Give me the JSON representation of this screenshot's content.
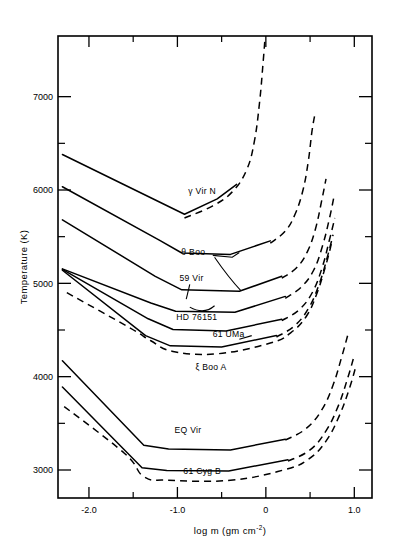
{
  "chart_data": {
    "type": "line",
    "title": "",
    "xlabel": "log m  (gm cm-2)",
    "xlabel_main": "log m  (gm cm",
    "xlabel_sup": "-2",
    "xlabel_tail": ")",
    "ylabel": "Temperature (K)",
    "xlim": [
      -2.35,
      1.2
    ],
    "ylim": [
      2700,
      7650
    ],
    "grid": false,
    "legend_position": "inline-labels",
    "xticks": [
      -2.0,
      -1.0,
      0,
      1.0
    ],
    "xticklabels": [
      "-2.0",
      "-1.0",
      "0",
      "1.0"
    ],
    "yticks": [
      7000,
      6000,
      5000,
      4000,
      3000
    ],
    "yticklabels": [
      "7000",
      "6000",
      "5000",
      "4000",
      "3000"
    ],
    "yminorticks": [
      6500,
      5500,
      4500,
      3500
    ],
    "xminorticks": [
      -1.5,
      -0.5,
      0.5
    ],
    "series": [
      {
        "name": "gamma Vir N",
        "label": "γ Vir N",
        "label_x": -0.72,
        "label_y": 5960,
        "style": "solid",
        "points": [
          [
            -2.3,
            6380
          ],
          [
            -0.92,
            5740
          ],
          [
            -0.55,
            5905
          ],
          [
            -0.33,
            6060
          ]
        ]
      },
      {
        "name": "gamma Vir N chromosphere",
        "label": "",
        "style": "dashed",
        "points": [
          [
            -0.92,
            5700
          ],
          [
            -0.6,
            5830
          ],
          [
            -0.38,
            5980
          ],
          [
            -0.22,
            6210
          ],
          [
            -0.13,
            6520
          ],
          [
            -0.07,
            6950
          ],
          [
            -0.03,
            7380
          ],
          [
            -0.01,
            7620
          ]
        ]
      },
      {
        "name": "theta Boo",
        "label": "θ  Boo",
        "label_x": -0.82,
        "label_y": 5300,
        "style": "solid",
        "points": [
          [
            -2.3,
            6035
          ],
          [
            -1.2,
            5460
          ],
          [
            -0.95,
            5325
          ],
          [
            -0.4,
            5310
          ],
          [
            0.05,
            5455
          ]
        ]
      },
      {
        "name": "theta Boo chromosphere",
        "label": "",
        "style": "dashed",
        "points": [
          [
            0.05,
            5430
          ],
          [
            0.22,
            5560
          ],
          [
            0.33,
            5740
          ],
          [
            0.42,
            6000
          ],
          [
            0.48,
            6310
          ],
          [
            0.52,
            6620
          ],
          [
            0.55,
            6790
          ]
        ]
      },
      {
        "name": "59 Vir",
        "label": "59 Vir",
        "label_x": -0.84,
        "label_y": 5030,
        "style": "solid",
        "points": [
          [
            -2.3,
            5680
          ],
          [
            -1.25,
            5075
          ],
          [
            -0.95,
            4930
          ],
          [
            -0.3,
            4915
          ],
          [
            0.18,
            5075
          ]
        ]
      },
      {
        "name": "59 Vir chromosphere",
        "label": "",
        "style": "dashed",
        "points": [
          [
            0.18,
            5055
          ],
          [
            0.35,
            5170
          ],
          [
            0.47,
            5340
          ],
          [
            0.56,
            5580
          ],
          [
            0.63,
            5880
          ],
          [
            0.68,
            6120
          ]
        ]
      },
      {
        "name": "HD 76151",
        "label": "HD 76151",
        "label_x": -0.78,
        "label_y": 4610,
        "style": "solid",
        "points": [
          [
            -2.3,
            5155
          ],
          [
            -1.3,
            4790
          ],
          [
            -1.02,
            4700
          ],
          [
            -0.35,
            4690
          ],
          [
            0.22,
            4860
          ]
        ]
      },
      {
        "name": "HD 76151 chromosphere",
        "label": "",
        "style": "dashed",
        "points": [
          [
            0.22,
            4840
          ],
          [
            0.4,
            4960
          ],
          [
            0.54,
            5140
          ],
          [
            0.64,
            5400
          ],
          [
            0.72,
            5700
          ],
          [
            0.77,
            5930
          ]
        ]
      },
      {
        "name": "61 UMa",
        "label": "61 UMa",
        "label_x": -0.42,
        "label_y": 4430,
        "style": "solid",
        "points": [
          [
            -2.3,
            5150
          ],
          [
            -1.33,
            4620
          ],
          [
            -1.05,
            4505
          ],
          [
            -0.45,
            4490
          ],
          [
            0.18,
            4615
          ]
        ]
      },
      {
        "name": "61 UMa chromosphere",
        "label": "",
        "style": "dashed",
        "points": [
          [
            0.18,
            4600
          ],
          [
            0.38,
            4720
          ],
          [
            0.53,
            4910
          ],
          [
            0.64,
            5180
          ],
          [
            0.72,
            5470
          ],
          [
            0.78,
            5700
          ]
        ]
      },
      {
        "name": "xi Boo A",
        "label": "ξ Boo A",
        "label_x": -0.62,
        "label_y": 4075,
        "style": "solid",
        "points": [
          [
            -2.3,
            5140
          ],
          [
            -1.36,
            4440
          ],
          [
            -1.08,
            4330
          ],
          [
            -0.5,
            4318
          ],
          [
            0.12,
            4440
          ]
        ]
      },
      {
        "name": "xi Boo A chromosphere",
        "label": "",
        "style": "dashed",
        "points": [
          [
            0.12,
            4425
          ],
          [
            0.33,
            4550
          ],
          [
            0.49,
            4745
          ],
          [
            0.61,
            5010
          ],
          [
            0.7,
            5300
          ],
          [
            0.76,
            5520
          ]
        ]
      },
      {
        "name": "xi Boo A lower",
        "label": "",
        "style": "dashed",
        "points": [
          [
            -2.25,
            4900
          ],
          [
            -1.55,
            4530
          ],
          [
            -1.3,
            4385
          ],
          [
            -1.05,
            4270
          ],
          [
            -0.55,
            4245
          ],
          [
            0.05,
            4360
          ],
          [
            0.28,
            4470
          ],
          [
            0.46,
            4650
          ],
          [
            0.58,
            4900
          ],
          [
            0.68,
            5200
          ],
          [
            0.74,
            5420
          ]
        ]
      },
      {
        "name": "EQ Vir",
        "label": "EQ Vir",
        "label_x": -0.88,
        "label_y": 3400,
        "style": "solid",
        "points": [
          [
            -2.3,
            4170
          ],
          [
            -1.38,
            3265
          ],
          [
            -1.1,
            3225
          ],
          [
            -0.4,
            3215
          ],
          [
            0.22,
            3330
          ]
        ]
      },
      {
        "name": "EQ Vir chromosphere",
        "label": "",
        "style": "dashed",
        "points": [
          [
            0.22,
            3320
          ],
          [
            0.45,
            3440
          ],
          [
            0.63,
            3640
          ],
          [
            0.76,
            3910
          ],
          [
            0.86,
            4220
          ],
          [
            0.93,
            4460
          ]
        ]
      },
      {
        "name": "61 Cyg B",
        "label": "61 Cyg B",
        "label_x": -0.72,
        "label_y": 2955,
        "style": "solid",
        "points": [
          [
            -2.3,
            3890
          ],
          [
            -1.4,
            3025
          ],
          [
            -1.12,
            2995
          ],
          [
            -0.42,
            2990
          ],
          [
            0.25,
            3110
          ]
        ]
      },
      {
        "name": "61 Cyg B chromosphere",
        "label": "",
        "style": "dashed",
        "points": [
          [
            0.25,
            3095
          ],
          [
            0.5,
            3215
          ],
          [
            0.68,
            3420
          ],
          [
            0.82,
            3690
          ],
          [
            0.93,
            4000
          ],
          [
            1.0,
            4230
          ]
        ]
      },
      {
        "name": "61 Cyg B lower",
        "label": "",
        "style": "dashed",
        "points": [
          [
            -2.28,
            3680
          ],
          [
            -1.6,
            3180
          ],
          [
            -1.38,
            2930
          ],
          [
            -1.1,
            2890
          ],
          [
            -0.4,
            2890
          ],
          [
            0.2,
            3000
          ],
          [
            0.48,
            3115
          ],
          [
            0.68,
            3310
          ],
          [
            0.83,
            3580
          ],
          [
            0.95,
            3890
          ],
          [
            1.02,
            4120
          ]
        ]
      }
    ],
    "annotations": [
      {
        "name": "theta-boo-leader-upper",
        "path": "M -0.60 5300 L -0.38 5280 L -0.30 5330"
      },
      {
        "name": "theta-boo-leader-lower",
        "path": "M -0.58 5280 Q -0.42 5060 -0.28 4920"
      },
      {
        "name": "59-vir-leader",
        "path": "M -0.86 4990 L -0.90 4830"
      },
      {
        "name": "59-vir-leader-curl",
        "path": "M -0.86 4745 Q -0.70 4660 -0.58 4760"
      },
      {
        "name": "61-uma-leader",
        "path": "M -0.30 4400 L -0.16 4440"
      }
    ]
  },
  "figure": {
    "background": "#ffffff",
    "line_color": "#000000",
    "frame": true
  }
}
